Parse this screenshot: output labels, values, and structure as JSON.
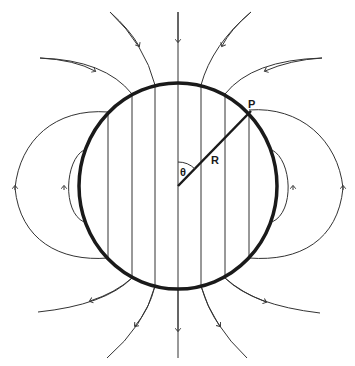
{
  "diagram": {
    "labels": {
      "point": "P",
      "radius": "R",
      "angle": "θ"
    },
    "colors": {
      "line": "#333333",
      "sphere": "#1a1a1a",
      "background": "#ffffff"
    },
    "sphere": {
      "cx": 178,
      "cy": 186,
      "r": 101
    },
    "interior_lines_x": [
      108,
      132,
      155,
      178,
      201,
      225,
      249
    ],
    "external_lines": {
      "top_incoming": 5,
      "bottom_outgoing": 5,
      "side_loops": 4
    }
  }
}
